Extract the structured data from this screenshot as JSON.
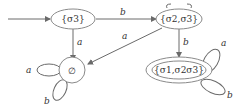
{
  "diagram": {
    "type": "finite-automaton",
    "states": [
      {
        "id": "s3",
        "label": "{σ3}",
        "initial": true,
        "accepting": false
      },
      {
        "id": "s23",
        "label": "{σ2,σ3}",
        "initial": false,
        "accepting": false
      },
      {
        "id": "empty",
        "label": "∅",
        "initial": false,
        "accepting": false
      },
      {
        "id": "s123",
        "label": "{σ1,σ2σ3}",
        "initial": false,
        "accepting": true
      }
    ],
    "transitions": [
      {
        "from": "s3",
        "to": "s23",
        "label": "b"
      },
      {
        "from": "s3",
        "to": "empty",
        "label": "a"
      },
      {
        "from": "s23",
        "to": "empty",
        "label": "a"
      },
      {
        "from": "s23",
        "to": "s123",
        "label": "b"
      },
      {
        "from": "empty",
        "to": "empty",
        "label": "a"
      },
      {
        "from": "empty",
        "to": "empty",
        "label": "b"
      },
      {
        "from": "s123",
        "to": "s123",
        "label": "a"
      },
      {
        "from": "s123",
        "to": "s123",
        "label": "b"
      }
    ]
  },
  "labels": {
    "s3": "{σ3}",
    "s23": "{σ2,σ3}",
    "empty": "∅",
    "s123": "{σ1,σ2σ3}",
    "e_s3_s23": "b",
    "e_s3_empty": "a",
    "e_s23_empty": "a",
    "e_s23_s123": "b",
    "loop_empty_a": "a",
    "loop_empty_b": "b",
    "loop_s123_a": "a",
    "loop_s123_b": "b"
  },
  "colors": {
    "stroke": "#8a8a8a",
    "text": "#333333"
  }
}
